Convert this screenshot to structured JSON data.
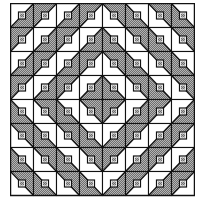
{
  "figure": {
    "kind": "quilt-block-layout",
    "pattern": "barn-raising",
    "rows": 8,
    "cols": 8,
    "cell_width": 23,
    "cell_height": 24,
    "colors": {
      "background": "#ffffff",
      "line": "#111111",
      "fill_dark": "#8a8a8a",
      "fill_light": "#b4b4b4"
    },
    "legend": "Each cell: half-square triangle; value = which half is shaded (UL, UR, LL, LR). Small square with diagonal at center of each cell.",
    "grid": [
      [
        "LR",
        "UL",
        "LR",
        "UL",
        "UR",
        "LL",
        "UR",
        "LL"
      ],
      [
        "UL",
        "LR",
        "UL",
        "LR",
        "LL",
        "UR",
        "LL",
        "UR"
      ],
      [
        "LR",
        "UL",
        "LR",
        "UL",
        "UR",
        "LL",
        "UR",
        "LL"
      ],
      [
        "UL",
        "LR",
        "UL",
        "LR",
        "LL",
        "UR",
        "LL",
        "UR"
      ],
      [
        "LL",
        "UR",
        "LL",
        "UR",
        "UL",
        "LR",
        "UL",
        "LR"
      ],
      [
        "UR",
        "LL",
        "UR",
        "LL",
        "LR",
        "UL",
        "LR",
        "UL"
      ],
      [
        "LL",
        "UR",
        "LL",
        "UR",
        "UL",
        "LR",
        "UL",
        "LR"
      ],
      [
        "UR",
        "LL",
        "UR",
        "LL",
        "LR",
        "UL",
        "LR",
        "UL"
      ]
    ]
  }
}
